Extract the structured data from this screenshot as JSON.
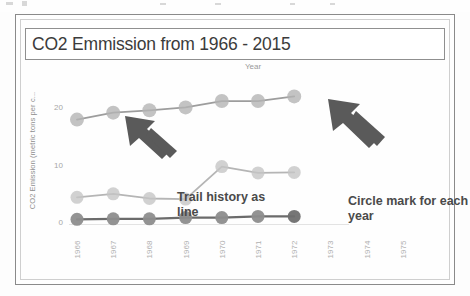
{
  "slide": {
    "title": "CO2 Emmission from 1966 - 2015"
  },
  "axis": {
    "x_title": "Year",
    "y_title": "CO2 Emission (metric tons per c...",
    "y_ticks": [
      "0",
      "10",
      "20"
    ],
    "x_ticks": [
      "1966",
      "1967",
      "1968",
      "1969",
      "1970",
      "1971",
      "1972",
      "1973",
      "1974",
      "1975"
    ]
  },
  "annotations": {
    "left": "Trail history as line",
    "right": "Circle mark for each year",
    "left_arrow_icon": "arrow-up-left-icon",
    "right_arrow_icon": "arrow-up-left-icon"
  },
  "colors": {
    "series_top": "#9d9d9d",
    "series_mid": "#b5b5b5",
    "series_bottom": "#6b6b6b",
    "marker_top": "#b4b4b4",
    "marker_mid": "#c6c6c6",
    "marker_bottom": "#8d8d8d",
    "frame": "#8a8a8a",
    "title_text": "#3b3b3b",
    "tick_text": "#a9a9a9",
    "annotation_text": "#4a4a4a",
    "arrow": "#5a5a5a"
  },
  "chart_data": {
    "type": "line",
    "title": "CO2 Emmission from 1966 - 2015",
    "xlabel": "Year",
    "ylabel": "CO2 Emission (metric tons per c...",
    "x": [
      "1966",
      "1967",
      "1968",
      "1969",
      "1970",
      "1971",
      "1972",
      "1973",
      "1974",
      "1975"
    ],
    "categories": [
      "1966",
      "1967",
      "1968",
      "1969",
      "1970",
      "1971",
      "1972"
    ],
    "ylim": [
      0,
      24
    ],
    "yticks": [
      0,
      10,
      20
    ],
    "grid": false,
    "legend": "none",
    "markers": "circle",
    "series": [
      {
        "name": "series-top",
        "color": "#9d9d9d",
        "values": [
          18.0,
          19.2,
          19.6,
          20.1,
          21.2,
          21.2,
          22.0
        ]
      },
      {
        "name": "series-middle",
        "color": "#b5b5b5",
        "values": [
          4.6,
          5.2,
          4.4,
          4.3,
          9.9,
          8.8,
          8.9
        ]
      },
      {
        "name": "series-bottom",
        "color": "#6b6b6b",
        "values": [
          0.8,
          0.9,
          0.9,
          1.1,
          1.1,
          1.3,
          1.3
        ]
      }
    ]
  }
}
